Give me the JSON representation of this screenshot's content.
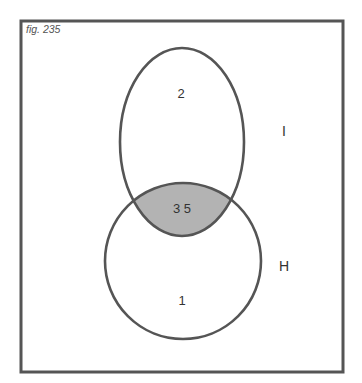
{
  "figure": {
    "caption": "fig. 235",
    "type": "venn-diagram"
  },
  "sets": [
    {
      "id": "I",
      "label": "I",
      "shape": "ellipse"
    },
    {
      "id": "H",
      "label": "H",
      "shape": "circle"
    }
  ],
  "regions": {
    "I_only": "2",
    "intersection": "3 5",
    "H_only": "1"
  },
  "colors": {
    "outline": "#555555",
    "intersection_fill": "#b3b3b3",
    "background": "#ffffff"
  }
}
